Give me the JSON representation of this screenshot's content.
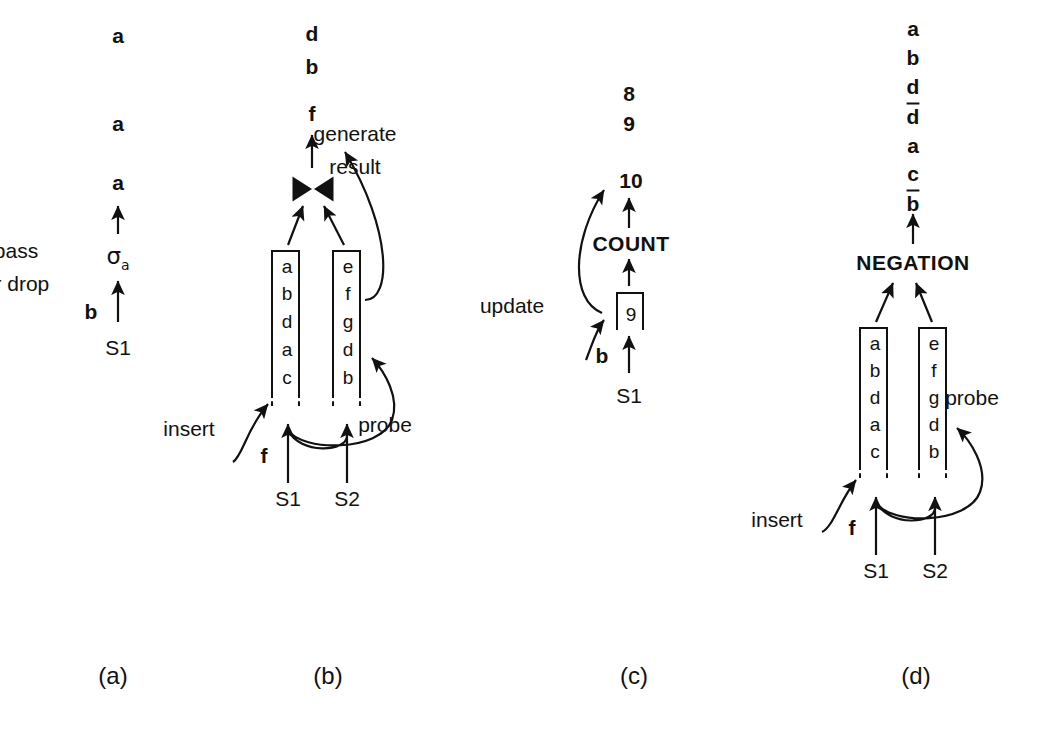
{
  "figure": {
    "background": "#ffffff",
    "ink": "#111111",
    "panel_labels": [
      "(a)",
      "(b)",
      "(c)",
      "(d)"
    ]
  },
  "panel_a": {
    "caption": "(a)",
    "output_stream": [
      "a",
      "a",
      "a"
    ],
    "operator": "σ",
    "operator_subscript": "a",
    "operator_name": "sigma-a",
    "annotation_line1": "pass",
    "annotation_line2": "or drop",
    "input_tuple": "b",
    "source": "S1"
  },
  "panel_b": {
    "caption": "(b)",
    "output_stream": [
      "d",
      "b",
      "f"
    ],
    "operator_symbol": "⋈",
    "operator_name": "join-bowtie",
    "annotation_line1": "generate",
    "annotation_line2": "result",
    "left_table_label": "S1",
    "right_table_label": "S2",
    "left_table": [
      "a",
      "b",
      "d",
      "a",
      "c"
    ],
    "right_table": [
      "e",
      "f",
      "g",
      "d",
      "b"
    ],
    "insert_label": "insert",
    "probe_label": "probe",
    "input_tuple": "f",
    "source_left": "S1",
    "source_right": "S2"
  },
  "panel_c": {
    "caption": "(c)",
    "output_stream": [
      "8",
      "9",
      "10"
    ],
    "operator": "COUNT",
    "counter_value": "9",
    "update_label": "update",
    "input_tuple": "b",
    "source": "S1"
  },
  "panel_d": {
    "caption": "(d)",
    "output_stream": [
      {
        "text": "a",
        "negated": false
      },
      {
        "text": "b",
        "negated": false
      },
      {
        "text": "d",
        "negated": false
      },
      {
        "text": "d",
        "negated": true
      },
      {
        "text": "a",
        "negated": false
      },
      {
        "text": "c",
        "negated": false
      },
      {
        "text": "b",
        "negated": true
      }
    ],
    "operator": "NEGATION",
    "left_table": [
      "a",
      "b",
      "d",
      "a",
      "c"
    ],
    "right_table": [
      "e",
      "f",
      "g",
      "d",
      "b"
    ],
    "insert_label": "insert",
    "probe_label": "probe",
    "input_tuple": "f",
    "source_left": "S1",
    "source_right": "S2"
  }
}
